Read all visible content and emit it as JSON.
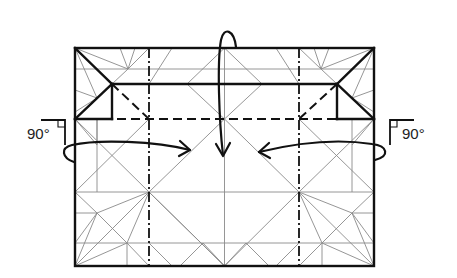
{
  "diagram": {
    "kind": "origami-crease-pattern-step",
    "colors": {
      "background": "#ffffff",
      "outline": "#111111",
      "crease": "#8a8a8a"
    },
    "paper": {
      "x": 75,
      "y": 48,
      "width": 299,
      "height": 218
    },
    "annotations": {
      "left_angle": "90°",
      "right_angle": "90°"
    },
    "line_types": {
      "thick": "fold edge / existing edge",
      "valley": "dashed valley fold",
      "mountain": "dash-dot mountain fold",
      "thin": "reference crease"
    },
    "arrows": [
      {
        "name": "top-fold-arrow",
        "direction": "down",
        "description": "loop arrow from top edge folding down to center"
      },
      {
        "name": "left-fold-arrow",
        "direction": "right",
        "description": "loop arrow from left edge folding inward"
      },
      {
        "name": "right-fold-arrow",
        "direction": "left",
        "description": "loop arrow from right edge folding inward"
      }
    ]
  }
}
